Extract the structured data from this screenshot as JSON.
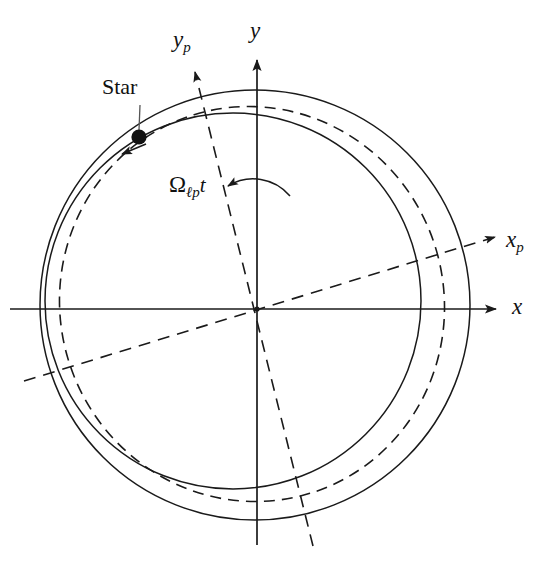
{
  "figure": {
    "type": "diagram",
    "background_color": "#ffffff",
    "stroke_color": "#1a1a1a"
  },
  "labels": {
    "star": "Star",
    "x_axis": "x",
    "y_axis": "y",
    "xp_axis_base": "x",
    "xp_axis_sub": "p",
    "yp_axis_base": "y",
    "yp_axis_sub": "p",
    "omega_symbol": "Ω",
    "omega_sub": "ℓp",
    "omega_time": "t"
  },
  "geometry": {
    "origin": {
      "x": 257,
      "y": 309
    },
    "axes": [
      {
        "name": "x-axis",
        "style": "solid",
        "from": {
          "x": 10,
          "y": 309
        },
        "to": {
          "x": 498,
          "y": 309
        },
        "arrow": true,
        "label_pos": {
          "x": 512,
          "y": 297
        }
      },
      {
        "name": "y-axis",
        "style": "solid",
        "from": {
          "x": 257,
          "y": 545
        },
        "to": {
          "x": 257,
          "y": 58
        },
        "arrow": true,
        "label_pos": {
          "x": 249,
          "y": 20
        }
      },
      {
        "name": "xp-axis",
        "style": "dashed",
        "angle_deg": -17,
        "from": {
          "x": 24,
          "y": 381
        },
        "to": {
          "x": 497,
          "y": 236
        },
        "arrow": true,
        "label_pos": {
          "x": 508,
          "y": 228
        }
      },
      {
        "name": "yp-axis",
        "style": "dashed",
        "angle_deg": -17,
        "from": {
          "x": 313,
          "y": 546
        },
        "to": {
          "x": 194,
          "y": 70
        },
        "arrow": true,
        "label_pos": {
          "x": 175,
          "y": 28
        }
      }
    ],
    "curves": [
      {
        "name": "outer-orbit-solid",
        "style": "solid",
        "center": {
          "x": 255,
          "y": 305
        },
        "rx": 215,
        "ry": 215,
        "rotation_deg": 0
      },
      {
        "name": "mean-orbit-dashed",
        "style": "dashed",
        "center": {
          "x": 252,
          "y": 304
        },
        "rx": 192,
        "ry": 198,
        "rotation_deg": -17
      },
      {
        "name": "inner-orbit-solid",
        "style": "solid",
        "center": {
          "x": 233,
          "y": 301
        },
        "rx": 188,
        "ry": 188,
        "rotation_deg": 0
      }
    ],
    "star_marker": {
      "x": 139,
      "y": 137,
      "radius": 7.5
    },
    "star_leader_line": {
      "from": {
        "x": 140,
        "y": 108
      },
      "to": {
        "x": 139,
        "y": 131
      }
    },
    "motion_arrow": {
      "tip": {
        "x": 121,
        "y": 154
      },
      "direction_deg": 225
    },
    "angle_arc": {
      "center": {
        "x": 257,
        "y": 309
      },
      "radius": 127,
      "start_deg": 90,
      "end_deg": 107,
      "arrow_at": "end"
    },
    "omega_label_pos": {
      "x": 171,
      "y": 172
    },
    "star_label_pos": {
      "x": 102,
      "y": 76
    }
  }
}
